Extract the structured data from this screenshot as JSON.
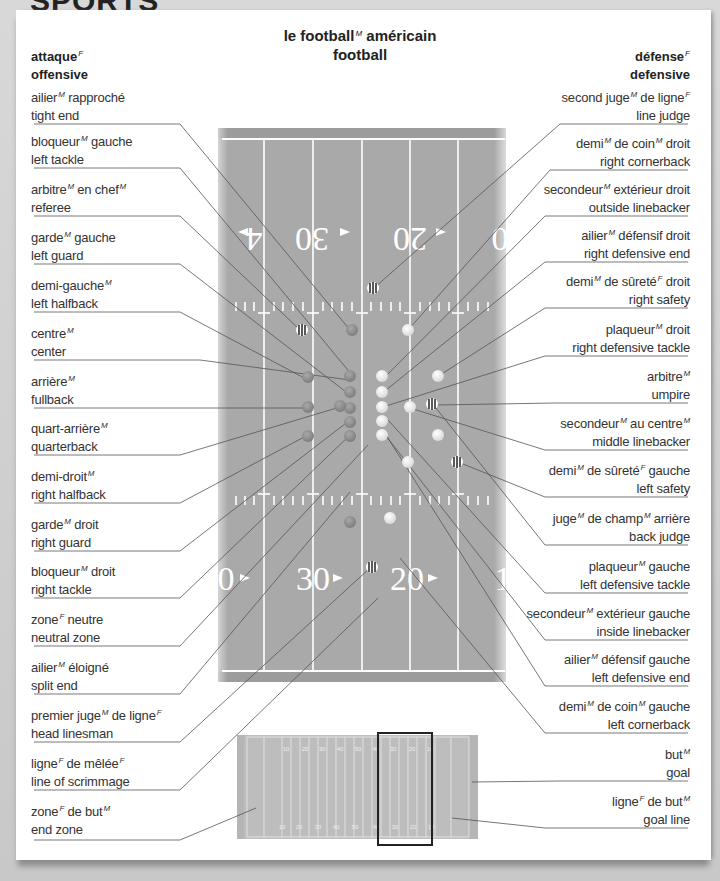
{
  "section": {
    "title": "SPORTS"
  },
  "header": {
    "title_fr": "le football",
    "title_fr_gender": "M",
    "title_fr_suffix": " américain",
    "title_en": "football",
    "offense_fr": "attaque",
    "offense_gender": "F",
    "offense_en": "offensive",
    "defense_fr": "défense",
    "defense_gender": "F",
    "defense_en": "defensive"
  },
  "offense_labels": [
    {
      "fr": "ailier",
      "g": "M",
      "fr2": " rapproché",
      "en": "tight end"
    },
    {
      "fr": "bloqueur",
      "g": "M",
      "fr2": " gauche",
      "en": "left tackle"
    },
    {
      "fr": "arbitre",
      "g": "M",
      "fr2": " en chef",
      "g2": "M",
      "en": "referee"
    },
    {
      "fr": "garde",
      "g": "M",
      "fr2": " gauche",
      "en": "left guard"
    },
    {
      "fr": "demi-gauche",
      "g": "M",
      "fr2": "",
      "en": "left halfback"
    },
    {
      "fr": "centre",
      "g": "M",
      "fr2": "",
      "en": "center"
    },
    {
      "fr": "arrière",
      "g": "M",
      "fr2": "",
      "en": "fullback"
    },
    {
      "fr": "quart-arrière",
      "g": "M",
      "fr2": "",
      "en": "quarterback"
    },
    {
      "fr": "demi-droit",
      "g": "M",
      "fr2": "",
      "en": "right halfback"
    },
    {
      "fr": "garde",
      "g": "M",
      "fr2": " droit",
      "en": "right guard"
    },
    {
      "fr": "bloqueur",
      "g": "M",
      "fr2": " droit",
      "en": "right tackle"
    },
    {
      "fr": "zone",
      "g": "F",
      "fr2": " neutre",
      "en": "neutral zone"
    },
    {
      "fr": "ailier",
      "g": "M",
      "fr2": " éloigné",
      "en": "split end"
    },
    {
      "fr": "premier juge",
      "g": "M",
      "fr2": " de ligne",
      "g2": "F",
      "en": "head linesman"
    },
    {
      "fr": "ligne",
      "g": "F",
      "fr2": " de mêlée",
      "g2": "F",
      "en": "line of scrimmage"
    },
    {
      "fr": "zone",
      "g": "F",
      "fr2": " de but",
      "g2": "M",
      "en": "end zone"
    }
  ],
  "defense_labels": [
    {
      "fr": "second juge",
      "g": "M",
      "fr2": " de ligne",
      "g2": "F",
      "en": "line judge"
    },
    {
      "fr": "demi",
      "g": "M",
      "fr2": " de coin",
      "g2": "M",
      "fr3": " droit",
      "en": "right cornerback"
    },
    {
      "fr": "secondeur",
      "g": "M",
      "fr2": " extérieur droit",
      "en": "outside linebacker"
    },
    {
      "fr": "ailier",
      "g": "M",
      "fr2": " défensif droit",
      "en": "right defensive end"
    },
    {
      "fr": "demi",
      "g": "M",
      "fr2": " de sûreté",
      "g2": "F",
      "fr3": " droit",
      "en": "right safety"
    },
    {
      "fr": "plaqueur",
      "g": "M",
      "fr2": " droit",
      "en": "right defensive tackle"
    },
    {
      "fr": "arbitre",
      "g": "M",
      "fr2": "",
      "en": "umpire"
    },
    {
      "fr": "secondeur",
      "g": "M",
      "fr2": " au centre",
      "g2": "M",
      "en": "middle linebacker"
    },
    {
      "fr": "demi",
      "g": "M",
      "fr2": " de sûreté",
      "g2": "F",
      "fr3": " gauche",
      "en": "left safety"
    },
    {
      "fr": "juge",
      "g": "M",
      "fr2": " de champ",
      "g2": "M",
      "fr3": " arrière",
      "en": "back judge"
    },
    {
      "fr": "plaqueur",
      "g": "M",
      "fr2": " gauche",
      "en": "left defensive tackle"
    },
    {
      "fr": "secondeur",
      "g": "M",
      "fr2": " extérieur gauche",
      "en": "inside linebacker"
    },
    {
      "fr": "ailier",
      "g": "M",
      "fr2": " défensif gauche",
      "en": "left defensive end"
    },
    {
      "fr": "demi",
      "g": "M",
      "fr2": " de coin",
      "g2": "M",
      "fr3": " gauche",
      "en": "left cornerback"
    },
    {
      "fr": "but",
      "g": "M",
      "fr2": "",
      "en": "goal"
    },
    {
      "fr": "ligne",
      "g": "F",
      "fr2": " de but",
      "g2": "M",
      "en": "goal line"
    }
  ],
  "field": {
    "top_numbers": [
      "4",
      "30",
      "20",
      "0"
    ],
    "bottom_numbers": [
      "0",
      "30",
      "20",
      "1"
    ],
    "mini_top_numbers": [
      "10",
      "20",
      "30",
      "40",
      "50",
      "40",
      "30",
      "20",
      "10"
    ],
    "mini_bottom_numbers": [
      "10",
      "20",
      "30",
      "40",
      "50",
      "40",
      "30",
      "20",
      "10"
    ],
    "colors": {
      "turf": "#a8a8a8",
      "offense_player": "#8e8e8e",
      "defense_player": "#eeeeee",
      "lines": "#ffffff"
    }
  }
}
